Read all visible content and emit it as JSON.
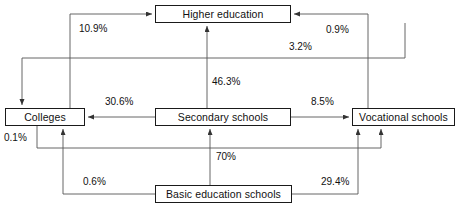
{
  "diagram": {
    "type": "flow-diagram",
    "title": "",
    "nodes": [
      {
        "id": "higher",
        "label": "Higher education",
        "x": 155,
        "y": 5,
        "w": 136,
        "h": 18
      },
      {
        "id": "colleges",
        "label": "Colleges",
        "x": 5,
        "y": 108,
        "w": 80,
        "h": 18
      },
      {
        "id": "secondary",
        "label": "Secondary schools",
        "x": 155,
        "y": 108,
        "w": 136,
        "h": 18
      },
      {
        "id": "vocational",
        "label": "Vocational schools",
        "x": 352,
        "y": 108,
        "w": 103,
        "h": 18
      },
      {
        "id": "basic",
        "label": "Basic education schools",
        "x": 155,
        "y": 185,
        "w": 137,
        "h": 18
      }
    ],
    "edges": [
      {
        "id": "colleges-to-higher",
        "from": "colleges",
        "to": "higher",
        "value": "10.9%"
      },
      {
        "id": "vocational-to-higher",
        "from": "vocational",
        "to": "higher",
        "value": "0.9%"
      },
      {
        "id": "higher-to-colleges",
        "from": "higher",
        "to": "colleges",
        "value": "3.2%"
      },
      {
        "id": "secondary-to-higher",
        "from": "secondary",
        "to": "higher",
        "value": "46.3%"
      },
      {
        "id": "secondary-to-colleges",
        "from": "secondary",
        "to": "colleges",
        "value": "30.6%"
      },
      {
        "id": "secondary-to-vocational",
        "from": "secondary",
        "to": "vocational",
        "value": "8.5%"
      },
      {
        "id": "colleges-to-vocational",
        "from": "colleges",
        "to": "vocational",
        "value": "0.1%"
      },
      {
        "id": "basic-to-colleges",
        "from": "basic",
        "to": "colleges",
        "value": "0.6%"
      },
      {
        "id": "basic-to-secondary",
        "from": "basic",
        "to": "secondary",
        "value": "70%"
      },
      {
        "id": "basic-to-vocational",
        "from": "basic",
        "to": "vocational",
        "value": "29.4%"
      }
    ],
    "edge_labels": [
      {
        "id": "label-10-9",
        "edge": "colleges-to-higher",
        "text": "10.9%",
        "x": 78,
        "y": 24
      },
      {
        "id": "label-0-9",
        "edge": "vocational-to-higher",
        "text": "0.9%",
        "x": 325,
        "y": 25
      },
      {
        "id": "label-3-2",
        "edge": "higher-to-colleges",
        "text": "3.2%",
        "x": 288,
        "y": 42
      },
      {
        "id": "label-46-3",
        "edge": "secondary-to-higher",
        "text": "46.3%",
        "x": 211,
        "y": 77
      },
      {
        "id": "label-30-6",
        "edge": "secondary-to-colleges",
        "text": "30.6%",
        "x": 104,
        "y": 97
      },
      {
        "id": "label-8-5",
        "edge": "secondary-to-vocational",
        "text": "8.5%",
        "x": 310,
        "y": 97
      },
      {
        "id": "label-0-1",
        "edge": "colleges-to-vocational",
        "text": "0.1%",
        "x": 3,
        "y": 133
      },
      {
        "id": "label-70",
        "edge": "basic-to-secondary",
        "text": "70%",
        "x": 215,
        "y": 152
      },
      {
        "id": "label-0-6",
        "edge": "basic-to-colleges",
        "text": "0.6%",
        "x": 82,
        "y": 177
      },
      {
        "id": "label-29-4",
        "edge": "basic-to-vocational",
        "text": "29.4%",
        "x": 320,
        "y": 177
      }
    ],
    "colors": {
      "line": "#444444",
      "box_border": "#1a1a1a",
      "text": "#111111",
      "background": "#ffffff"
    }
  }
}
